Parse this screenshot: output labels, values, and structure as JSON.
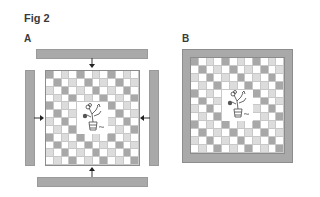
{
  "figure": {
    "title": "Fig 2",
    "panels": [
      {
        "label": "A",
        "description": "Checkerboard field with central plant; four separate grey barriers with arrows pointing inward"
      },
      {
        "label": "B",
        "description": "Checkerboard field with central plant enclosed by a continuous grey frame"
      }
    ]
  },
  "grid": {
    "rows": 12,
    "cols": 12,
    "center_blank": {
      "row_start": 4,
      "row_end": 7,
      "col_start": 4,
      "col_end": 7
    },
    "pattern_rule": "dark if (col-row) mod 4 == 0; light if (col-row) mod 4 == 2; else white",
    "colors": {
      "dark": "#a8a8a8",
      "light": "#dcdcdc",
      "empty": "#ffffff",
      "barrier": "#a9a9a9"
    }
  },
  "panelA": {
    "arrows": [
      {
        "direction": "down",
        "position": "top"
      },
      {
        "direction": "up",
        "position": "bottom"
      },
      {
        "direction": "right",
        "position": "left"
      },
      {
        "direction": "left",
        "position": "right"
      }
    ],
    "icons": {
      "plant": "plant-icon",
      "arrow": "arrow-icon"
    }
  },
  "panelB": {
    "icons": {
      "plant": "plant-icon"
    }
  }
}
